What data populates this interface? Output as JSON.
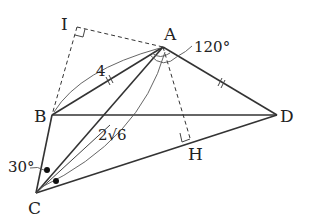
{
  "diagram": {
    "type": "geometry-figure",
    "points": {
      "A": {
        "label": "A",
        "x": 163,
        "y": 47
      },
      "B": {
        "label": "B",
        "x": 52,
        "y": 115
      },
      "C": {
        "label": "C",
        "x": 36,
        "y": 193
      },
      "D": {
        "label": "D",
        "x": 277,
        "y": 115
      },
      "I": {
        "label": "I",
        "x": 77,
        "y": 27
      },
      "H": {
        "label": "H",
        "x": 190,
        "y": 138
      }
    },
    "labels": {
      "AB_length": "4",
      "AC_length": "2√6",
      "angle_BAD": "120°",
      "angle_BCA": "30°"
    },
    "segments": [
      {
        "from": "A",
        "to": "B",
        "style": "solid",
        "tick": "double"
      },
      {
        "from": "A",
        "to": "D",
        "style": "solid",
        "tick": "double"
      },
      {
        "from": "B",
        "to": "D",
        "style": "solid"
      },
      {
        "from": "B",
        "to": "C",
        "style": "solid"
      },
      {
        "from": "C",
        "to": "D",
        "style": "solid"
      },
      {
        "from": "A",
        "to": "C",
        "style": "solid"
      },
      {
        "from": "I",
        "to": "A",
        "style": "dashed"
      },
      {
        "from": "I",
        "to": "B",
        "style": "dashed"
      },
      {
        "from": "A",
        "to": "H",
        "style": "dashed"
      }
    ],
    "right_angles": [
      "I",
      "H"
    ],
    "equal_angle_marks": [
      "angle BCA",
      "angle ACD"
    ]
  }
}
